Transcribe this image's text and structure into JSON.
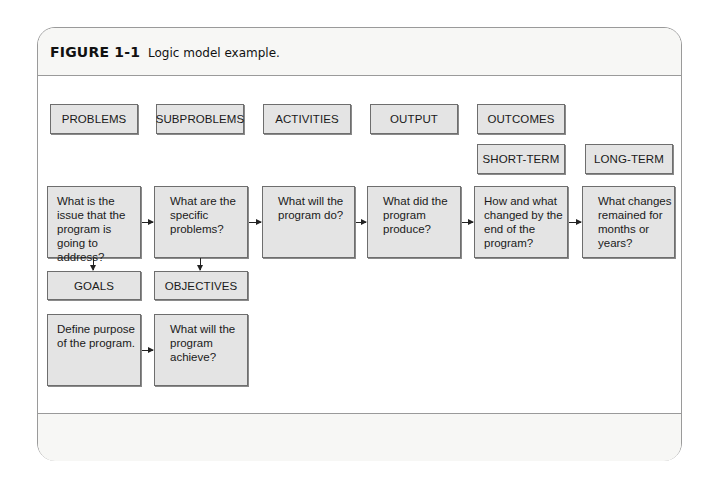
{
  "figure": {
    "number": "FIGURE 1-1",
    "caption": "Logic model example."
  },
  "headers": {
    "problems": "PROBLEMS",
    "subproblems": "SUBPROBLEMS",
    "activities": "ACTIVITIES",
    "output": "OUTPUT",
    "outcomes": "OUTCOMES",
    "short_term": "SHORT-TERM",
    "long_term": "LONG-TERM",
    "goals": "GOALS",
    "objectives": "OBJECTIVES"
  },
  "questions": {
    "problems": "What is the issue that the program is going to address?",
    "subproblems": "What are the specific problems?",
    "activities": "What will the program do?",
    "output": "What did the program produce?",
    "short_term": "How and what changed by the end of the program?",
    "long_term": "What changes remained for months or years?",
    "goals": "Define purpose of the program.",
    "objectives": "What will the program achieve?"
  },
  "colors": {
    "box_fill": "#e4e4e4",
    "box_border": "#6e6e6e",
    "frame_border": "#9a9a9a",
    "band_fill": "#f7f7f5"
  }
}
